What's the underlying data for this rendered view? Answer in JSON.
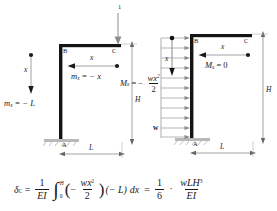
{
  "figure": {
    "title_absent": true,
    "left_frame": {
      "name": "unit-load-frame",
      "joint_labels": {
        "base": "A",
        "corner": "B",
        "tip": "C"
      },
      "load": {
        "magnitude": "1",
        "direction": "down",
        "applied_at": "C"
      },
      "dimension_H": "H",
      "dimension_L": "L",
      "column_coordinate": "x",
      "beam_coordinate": "x",
      "moment_column": "m",
      "moment_column_sub": "x",
      "moment_column_eq": "= − L",
      "moment_beam": "m",
      "moment_beam_sub": "x",
      "moment_beam_eq": "= − x"
    },
    "right_frame": {
      "name": "distributed-load-frame",
      "joint_labels": {
        "base": "A",
        "corner": "B",
        "tip": "C"
      },
      "load": {
        "symbol": "w",
        "type": "uniform-distributed",
        "direction": "right",
        "applied_on": "column"
      },
      "dimension_H": "H",
      "dimension_L": "L",
      "column_coordinate": "x",
      "beam_coordinate": "x",
      "moment_beam": "M",
      "moment_beam_sub": "x",
      "moment_beam_eq": "= 0",
      "moment_column": "M",
      "moment_column_sub": "x",
      "moment_column_eqsign": "=",
      "moment_column_minus": "−",
      "moment_column_num": "wx",
      "moment_column_num_sup": "2",
      "moment_column_den": "2"
    },
    "equation": {
      "lhs_symbol": "δ",
      "lhs_sub": "C",
      "equals": "=",
      "frac1_num": "1",
      "frac1_den": "EI",
      "integral": "∫",
      "limit_upper": "H",
      "limit_lower": "0",
      "paren_open": "(",
      "minus": "−",
      "frac2_num": "wx",
      "frac2_num_sup": "2",
      "frac2_den": "2",
      "paren_close": ")",
      "factor": "(− L)",
      "differential": "dx",
      "equals2": "=",
      "frac3_num": "1",
      "frac3_den": "6",
      "dot": "·",
      "frac4_num": "wLH",
      "frac4_num_sup": "3",
      "frac4_den": "EI"
    }
  },
  "colors": {
    "member": "#141414",
    "dimension_line": "#8c8c8c",
    "load_arrow": "#8c8c8c",
    "support": "#b3b3b3",
    "text": "#1a1a1a"
  }
}
